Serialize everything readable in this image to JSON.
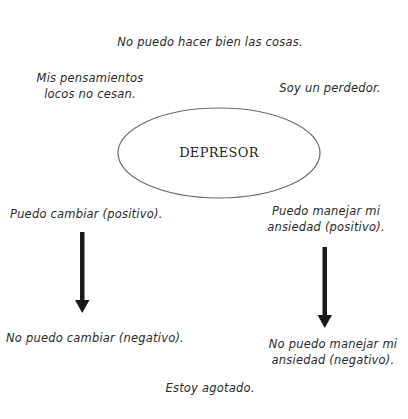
{
  "diagram": {
    "center": {
      "label": "DEPRESOR",
      "shape": "ellipse"
    },
    "thoughts": {
      "top": "No puedo hacer bien las cosas.",
      "top_left": [
        "Mis pensamientos",
        "locos no cesan."
      ],
      "top_right": "Soy un perdedor.",
      "bottom": "Estoy agotado."
    },
    "transitions": [
      {
        "from": "Puedo cambiar (positivo).",
        "to": "No puedo cambiar (negativo).",
        "arrow": "down-arrow"
      },
      {
        "from": [
          "Puedo manejar mi",
          "ansiedad (positivo)."
        ],
        "to": [
          "No puedo manejar mi",
          "ansiedad (negativo)."
        ],
        "arrow": "down-arrow"
      }
    ]
  },
  "colors": {
    "background": "#ffffff",
    "text": "#2a2a2a",
    "ellipse_stroke": "#6a6a6a",
    "arrow": "#1a1a1a"
  }
}
